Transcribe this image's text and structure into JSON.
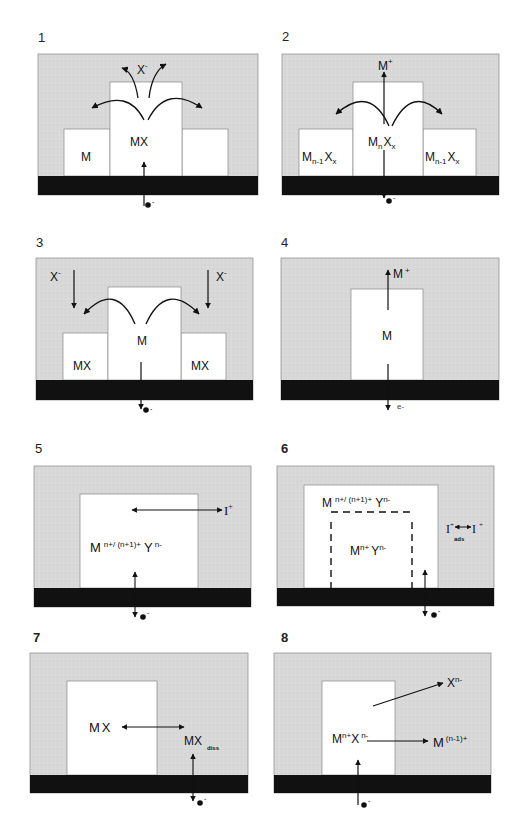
{
  "figure": {
    "colors": {
      "electrolyte": "#d9d9d9",
      "substrate": "#111111",
      "deposit": "#ffffff",
      "outline": "#777777",
      "arrow": "#111111"
    },
    "panels": [
      {
        "id": "1",
        "label": "1",
        "species": [
          "X",
          "-",
          "M",
          "MX"
        ],
        "electron": "e",
        "electron_charge": "-"
      },
      {
        "id": "2",
        "label": "2",
        "species": [
          "M",
          "+",
          "M",
          "n",
          "X",
          "x",
          "M",
          "n-1",
          "X",
          "x"
        ],
        "electron": "e",
        "electron_charge": "-"
      },
      {
        "id": "3",
        "label": "3",
        "species": [
          "X",
          "-",
          "M",
          "MX"
        ],
        "electron": "e",
        "electron_charge": "-"
      },
      {
        "id": "4",
        "label": "4",
        "species": [
          "M",
          "+",
          "M"
        ],
        "electron": "e",
        "electron_charge": "-"
      },
      {
        "id": "5",
        "label": "5",
        "species": [
          "M",
          "n+/ (n+1)+",
          "Y",
          "n-",
          "I",
          "+"
        ],
        "electron": "e",
        "electron_charge": "-"
      },
      {
        "id": "6",
        "label": "6",
        "species": [
          "M",
          "n+/ (n+1)+",
          "Y",
          "n-",
          "M",
          "n+",
          "Y",
          "n-",
          "I",
          "+",
          "ads"
        ],
        "electron": "e",
        "electron_charge": "-"
      },
      {
        "id": "7",
        "label": "7",
        "species": [
          "MX",
          "MX",
          "diss"
        ],
        "electron": "e",
        "electron_charge": "-"
      },
      {
        "id": "8",
        "label": "8",
        "species": [
          "M",
          "n+",
          "X",
          "n-",
          "X",
          "n-",
          "M",
          "(n-1)+"
        ],
        "electron": "e",
        "electron_charge": "-"
      }
    ]
  }
}
